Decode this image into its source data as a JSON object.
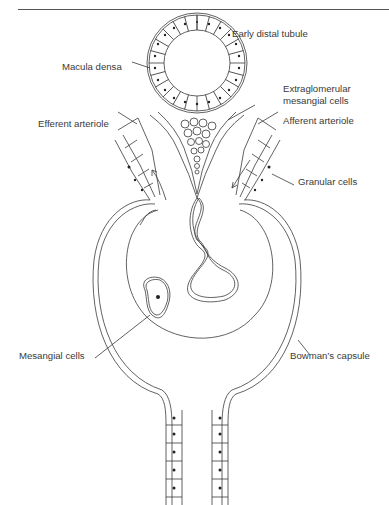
{
  "figure": {
    "labels": {
      "early_distal_tubule": "Early distal tubule",
      "macula_densa": "Macula densa",
      "extraglomerular_line1": "Extraglomerular",
      "extraglomerular_line2": "mesangial cells",
      "efferent_arteriole": "Efferent arteriole",
      "afferent_arteriole": "Afferent arteriole",
      "granular_cells": "Granular cells",
      "mesangial_cells": "Mesangial cells",
      "bowmans_capsule": "Bowman’s capsule"
    },
    "colors": {
      "line": "#3a3a3a",
      "background": "#ffffff"
    }
  }
}
